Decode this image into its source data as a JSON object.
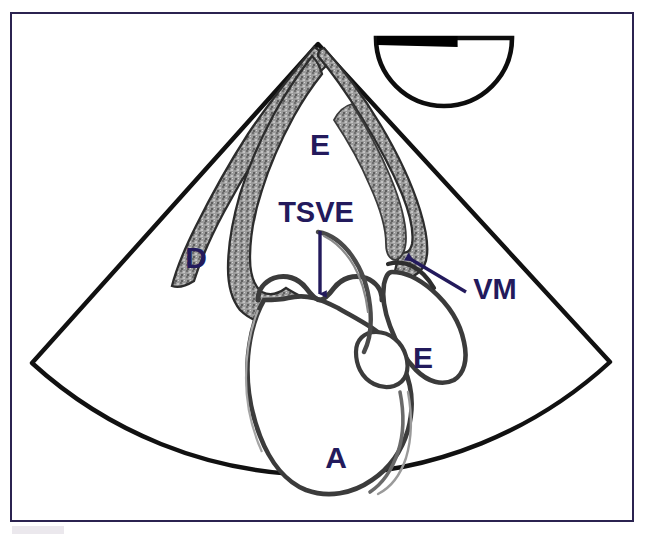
{
  "figure": {
    "kind": "ultrasound-sector-schematic",
    "modality_note": "cardiac ultrasound sector scan line drawing",
    "frame_color": "#2b2350",
    "background_color": "#ffffff",
    "outline_color": "#121212",
    "myocardium_fill": "#8d8d8d",
    "label_color": "#231a5c"
  },
  "orientation_marker": {
    "name": "probe-orientation-marker",
    "shape": "half-disc-dome-down",
    "marker_bar_color": "#000000",
    "center_x": 444,
    "top_y": 38,
    "radius": 68
  },
  "sector": {
    "apex_x": 318,
    "apex_y": 44,
    "left_corner_x": 32,
    "left_corner_y": 363,
    "right_corner_x": 610,
    "right_corner_y": 362,
    "arc_bottom_y": 492
  },
  "labels": [
    {
      "id": "label-e-upper",
      "text": "E",
      "x": 320,
      "y": 155,
      "size": "single"
    },
    {
      "id": "label-d",
      "text": "D",
      "x": 196,
      "y": 268,
      "size": "single"
    },
    {
      "id": "label-tsve",
      "text": "TSVE",
      "x": 316,
      "y": 222,
      "size": "word"
    },
    {
      "id": "label-vm",
      "text": "VM",
      "x": 495,
      "y": 299,
      "size": "word"
    },
    {
      "id": "label-e-lower",
      "text": "E",
      "x": 423,
      "y": 368,
      "size": "single"
    },
    {
      "id": "label-a",
      "text": "A",
      "x": 336,
      "y": 468,
      "size": "single"
    }
  ],
  "annotations": {
    "tsve_arrow": {
      "name": "tsve-pointer-arrow",
      "direction": "down",
      "x1": 320,
      "y1": 231,
      "x2": 320,
      "y2": 294,
      "color": "#231a5c"
    },
    "vm_arrow": {
      "name": "vm-pointer-arrow",
      "direction": "up-left",
      "x1": 466,
      "y1": 292,
      "x2": 407,
      "y2": 257,
      "color": "#231a5c"
    }
  },
  "structures": [
    {
      "id": "ventricle-chamber-upper",
      "label": "E",
      "description": "upper chamber bounded by thick speckled myocardium"
    },
    {
      "id": "chamber-d",
      "label": "D",
      "description": "left-side chamber between sector edge and septum"
    },
    {
      "id": "outflow-tract",
      "label": "TSVE",
      "description": "outflow tract indicated by downward arrow"
    },
    {
      "id": "mitral-valve",
      "label": "VM",
      "description": "valve leaflet indicated by diagonal arrow"
    },
    {
      "id": "chamber-e-lower",
      "label": "E",
      "description": "lower right chamber with thin outline"
    },
    {
      "id": "aorta-chamber",
      "label": "A",
      "description": "large lower chamber with thin outline"
    }
  ]
}
